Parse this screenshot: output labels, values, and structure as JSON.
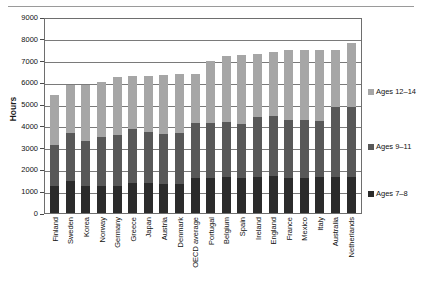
{
  "chart_data": {
    "type": "bar",
    "subtype": "stacked-bar",
    "title": "",
    "subtitle": "",
    "xlabel": "",
    "ylabel": "Hours",
    "ylim": [
      0,
      9000
    ],
    "ytick_step": 1000,
    "yticks": [
      "9000",
      "8000",
      "7000",
      "6000",
      "5000",
      "4000",
      "3000",
      "2000",
      "1000",
      "0"
    ],
    "grid": true,
    "legend_position": "right",
    "categories": [
      "Finland",
      "Sweden",
      "Korea",
      "Norway",
      "Germany",
      "Greece",
      "Japan",
      "Austria",
      "Denmark",
      "OECD average",
      "Portugal",
      "Belgium",
      "Spain",
      "Ireland",
      "England",
      "France",
      "Mexico",
      "Italy",
      "Australia",
      "Netherlands"
    ],
    "series": [
      {
        "name": "Ages 7–8",
        "color": "#2b2b2b",
        "values": [
          1250,
          1450,
          1250,
          1230,
          1220,
          1400,
          1380,
          1340,
          1350,
          1630,
          1630,
          1650,
          1600,
          1640,
          1710,
          1630,
          1630,
          1650,
          1650,
          1670
        ]
      },
      {
        "name": "Ages 9–11",
        "color": "#585858",
        "values": [
          1870,
          2230,
          2060,
          2260,
          2370,
          2470,
          2340,
          2270,
          2340,
          2520,
          2520,
          2520,
          2500,
          2780,
          2760,
          2620,
          2640,
          2580,
          3230,
          3180
        ]
      },
      {
        "name": "Ages 12–14",
        "color": "#a6a6a6",
        "values": [
          2280,
          2220,
          2590,
          2510,
          2660,
          2410,
          2560,
          2740,
          2700,
          2250,
          2850,
          3030,
          3150,
          2880,
          2930,
          3250,
          3220,
          3270,
          2620,
          2950
        ]
      }
    ],
    "totals": [
      5400,
      5900,
      5900,
      6000,
      6250,
      6280,
      6280,
      6350,
      6390,
      6400,
      7000,
      7200,
      7250,
      7300,
      7400,
      7500,
      7490,
      7500,
      7500,
      7800
    ]
  },
  "legend": {
    "items": [
      {
        "label": "Ages 12–14",
        "color": "#a6a6a6"
      },
      {
        "label": "Ages 9–11",
        "color": "#585858"
      },
      {
        "label": "Ages 7–8",
        "color": "#2b2b2b"
      }
    ]
  }
}
